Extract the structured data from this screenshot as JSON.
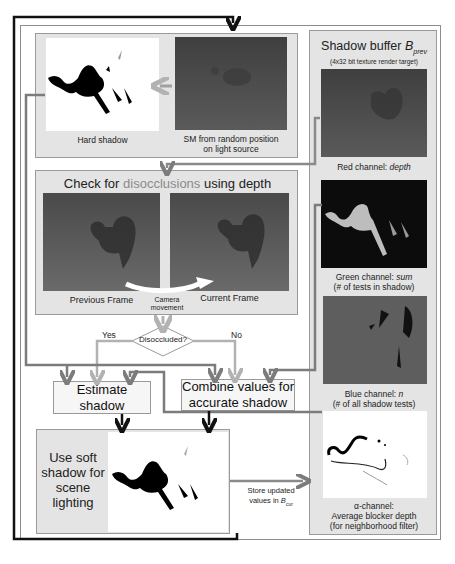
{
  "top_panel": {
    "hard_shadow_caption": "Hard shadow",
    "sm_caption_line1": "SM from random position",
    "sm_caption_line2": "on light source"
  },
  "disocclusion_panel": {
    "title_prefix": "Check for ",
    "title_highlight": "disocclusions",
    "title_suffix": " using depth",
    "previous_frame": "Previous Frame",
    "current_frame": "Current Frame",
    "camera_movement_line1": "Camera",
    "camera_movement_line2": "movement"
  },
  "decision": {
    "label": "Disoccluded?",
    "yes": "Yes",
    "no": "No"
  },
  "estimate_box": {
    "line1": "Estimate",
    "line2": "shadow"
  },
  "combine_box": {
    "line1": "Combine values for",
    "line2": "accurate shadow"
  },
  "soft_shadow_panel": {
    "line1": "Use soft",
    "line2": "shadow for",
    "line3": "scene",
    "line4": "lighting"
  },
  "store_label": {
    "line1": "Store updated",
    "line2_prefix": "values in ",
    "line2_var": "B",
    "line2_sub": "cur"
  },
  "shadow_buffer": {
    "title_prefix": "Shadow buffer ",
    "title_var": "B",
    "title_sub": "prev",
    "subtitle": "(4x32 bit texture render target)",
    "red_caption_prefix": "Red channel: ",
    "red_caption_em": "depth",
    "green_caption_prefix": "Green channel: ",
    "green_caption_em": "sum",
    "green_caption_line2": "(# of tests in shadow)",
    "blue_caption_prefix": "Blue channel: ",
    "blue_caption_em": "n",
    "blue_caption_line2": "(# of all shadow tests)",
    "alpha_caption_line1": "α-channel:",
    "alpha_caption_line2": "Average blocker depth",
    "alpha_caption_line3": "(for neighborhood filter)"
  },
  "colors": {
    "panel_bg": "#e4e4e4",
    "arrow_grey": "#8a8a8a",
    "arrow_light": "#b5b5b5",
    "arrow_black": "#111111",
    "highlight_text": "#8a8a8a"
  }
}
